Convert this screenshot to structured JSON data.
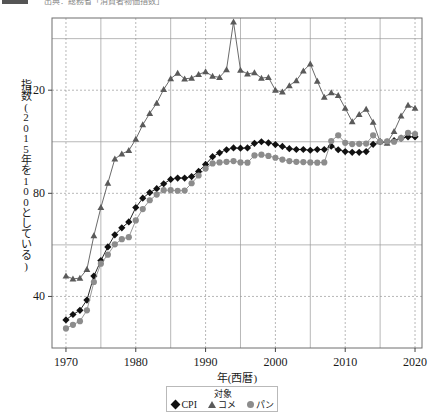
{
  "topbar": {
    "badge": "figure-tag",
    "caption": "出典：総務省「消費者物価指数」"
  },
  "chart_data": {
    "type": "line",
    "title": "",
    "xlabel": "年(西暦)",
    "ylabel": "指数(2015年を100としている)",
    "xlim": [
      1968,
      2021
    ],
    "ylim": [
      20,
      148
    ],
    "xticks": [
      1970,
      1980,
      1990,
      2000,
      2010,
      2020
    ],
    "xticklabels": [
      "1970",
      "1980",
      "1990",
      "2000",
      "2010",
      "2020"
    ],
    "yticks": [
      40,
      80,
      120
    ],
    "yticklabels": [
      "40",
      "80",
      "120"
    ],
    "grid": "both",
    "grid_minor_x": [
      1975,
      1985,
      1995,
      2005,
      2015
    ],
    "grid_minor_y": [
      60,
      100,
      140
    ],
    "legend_title": "対象",
    "legend_position": "bottom-center",
    "x": [
      1970,
      1971,
      1972,
      1973,
      1974,
      1975,
      1976,
      1977,
      1978,
      1979,
      1980,
      1981,
      1982,
      1983,
      1984,
      1985,
      1986,
      1987,
      1988,
      1989,
      1990,
      1991,
      1992,
      1993,
      1994,
      1995,
      1996,
      1997,
      1998,
      1999,
      2000,
      2001,
      2002,
      2003,
      2004,
      2005,
      2006,
      2007,
      2008,
      2009,
      2010,
      2011,
      2012,
      2013,
      2014,
      2015,
      2016,
      2017,
      2018,
      2019,
      2020
    ],
    "series": [
      {
        "name": "CPI",
        "marker": "diamond",
        "color": "#111111",
        "values": [
          30.9,
          33.0,
          34.6,
          38.6,
          47.9,
          53.9,
          59.2,
          63.9,
          66.6,
          68.9,
          74.5,
          78.1,
          80.3,
          81.8,
          83.7,
          85.4,
          85.9,
          85.9,
          86.5,
          88.5,
          91.2,
          94.2,
          95.7,
          96.9,
          97.6,
          97.5,
          97.6,
          99.4,
          100.0,
          99.6,
          98.9,
          98.2,
          97.3,
          97.0,
          97.0,
          96.7,
          97.0,
          97.0,
          98.3,
          96.9,
          96.2,
          95.9,
          95.9,
          96.2,
          99.0,
          100.0,
          99.9,
          100.4,
          101.4,
          101.9,
          101.9
        ]
      },
      {
        "name": "コメ",
        "marker": "triangle",
        "color": "#5a5a5a",
        "values": [
          48.0,
          46.8,
          47.1,
          50.5,
          63.6,
          74.5,
          83.9,
          93.3,
          95.3,
          96.6,
          101.0,
          106.6,
          111.0,
          115.0,
          120.3,
          124.5,
          126.6,
          124.4,
          124.7,
          126.1,
          127.2,
          125.4,
          125.0,
          128.0,
          146.5,
          127.8,
          126.3,
          126.8,
          124.7,
          125.0,
          120.0,
          119.3,
          121.8,
          123.7,
          127.5,
          130.2,
          123.5,
          117.3,
          119.0,
          118.0,
          113.0,
          107.8,
          110.6,
          112.6,
          107.6,
          100.0,
          99.5,
          104.0,
          110.0,
          114.2,
          113.0
        ]
      },
      {
        "name": "パン",
        "marker": "circle",
        "color": "#8c8c8c",
        "values": [
          27.6,
          29.0,
          30.4,
          34.6,
          45.6,
          52.7,
          56.2,
          60.2,
          62.2,
          63.0,
          69.5,
          73.9,
          77.3,
          79.5,
          81.2,
          81.2,
          81.0,
          81.1,
          83.9,
          86.9,
          89.6,
          91.6,
          92.0,
          92.2,
          92.5,
          92.0,
          91.9,
          94.7,
          95.0,
          94.5,
          93.8,
          93.1,
          92.5,
          92.2,
          92.1,
          92.0,
          91.9,
          92.0,
          100.3,
          102.5,
          99.6,
          99.1,
          99.2,
          99.3,
          102.5,
          100.0,
          100.2,
          100.0,
          101.4,
          103.5,
          103.0
        ]
      }
    ]
  },
  "legend": {
    "title": "対象",
    "entries": [
      {
        "marker": "diamond-marker",
        "label": "CPI"
      },
      {
        "marker": "triangle-marker",
        "label": "コメ"
      },
      {
        "marker": "circle-marker",
        "label": "パン"
      }
    ]
  }
}
